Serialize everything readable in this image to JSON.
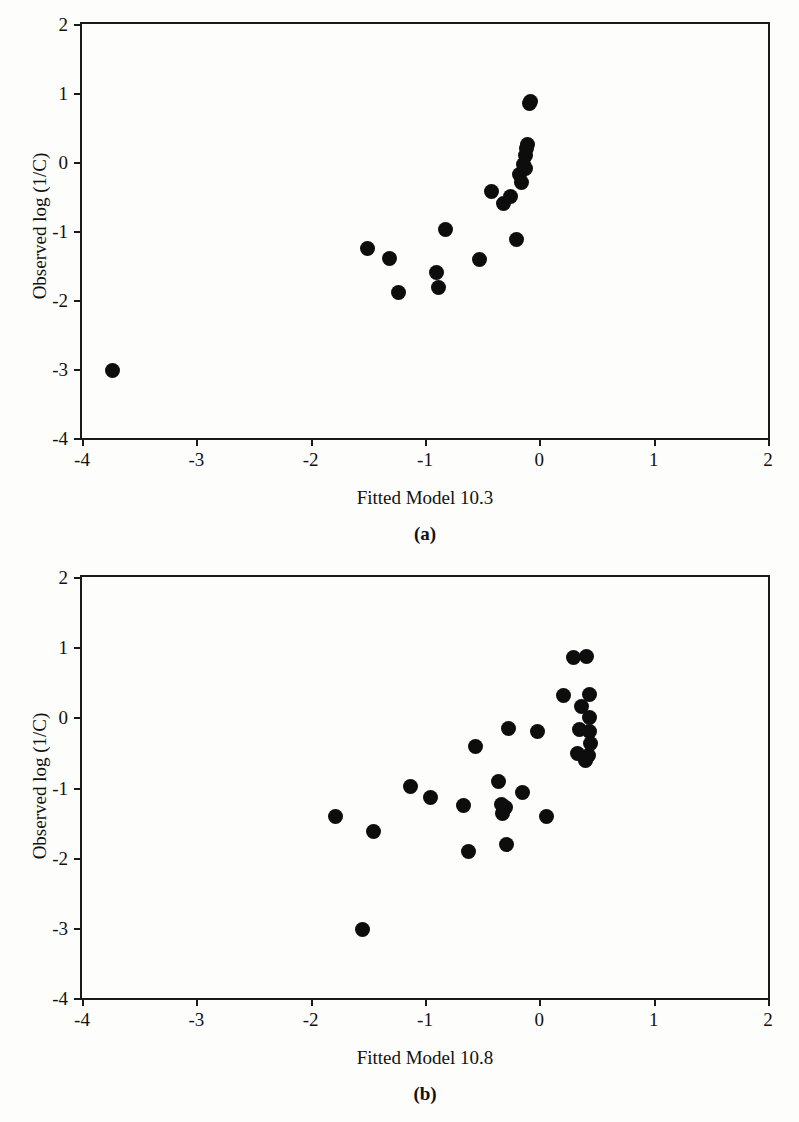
{
  "figure": {
    "background_color": "#fdfdfc",
    "marker_color": "#0d0d0d",
    "axis_color": "#1a1a1a"
  },
  "panels": [
    {
      "caption": "(a)",
      "chart_data": {
        "type": "scatter",
        "title": "",
        "xlabel": "Fitted Model 10.3",
        "ylabel": "Observed log (1/C)",
        "xlim": [
          -4,
          2
        ],
        "ylim": [
          -4,
          2
        ],
        "xticks": [
          -4,
          -3,
          -2,
          -1,
          0,
          1,
          2
        ],
        "xticklabels": [
          "-4",
          "-3",
          "-2",
          "-1",
          "0",
          "1",
          "2"
        ],
        "yticks": [
          -4,
          -3,
          -2,
          -1,
          0,
          1,
          2
        ],
        "yticklabels": [
          "-4",
          "-3",
          "-2",
          "-1",
          "0",
          "1",
          "2"
        ],
        "grid": false,
        "legend": false,
        "marker": "filled-circle",
        "points": [
          [
            -3.73,
            -3.02
          ],
          [
            -1.5,
            -1.25
          ],
          [
            -1.31,
            -1.4
          ],
          [
            -1.23,
            -1.89
          ],
          [
            -0.9,
            -1.6
          ],
          [
            -0.88,
            -1.82
          ],
          [
            -0.82,
            -0.98
          ],
          [
            -0.52,
            -1.41
          ],
          [
            -0.42,
            -0.43
          ],
          [
            -0.31,
            -0.6
          ],
          [
            -0.25,
            -0.5
          ],
          [
            -0.2,
            -1.13
          ],
          [
            -0.17,
            -0.18
          ],
          [
            -0.14,
            -0.03
          ],
          [
            -0.12,
            0.1
          ],
          [
            -0.11,
            0.2
          ],
          [
            -0.1,
            0.26
          ],
          [
            -0.12,
            -0.1
          ],
          [
            -0.09,
            0.85
          ],
          [
            -0.08,
            0.87
          ],
          [
            -0.16,
            -0.3
          ]
        ]
      }
    },
    {
      "caption": "(b)",
      "chart_data": {
        "type": "scatter",
        "title": "",
        "xlabel": "Fitted Model 10.8",
        "ylabel": "Observed log (1/C)",
        "xlim": [
          -4,
          2
        ],
        "ylim": [
          -4,
          2
        ],
        "xticks": [
          -4,
          -3,
          -2,
          -1,
          0,
          1,
          2
        ],
        "xticklabels": [
          "-4",
          "-3",
          "-2",
          "-1",
          "0",
          "1",
          "2"
        ],
        "yticks": [
          -4,
          -3,
          -2,
          -1,
          0,
          1,
          2
        ],
        "yticklabels": [
          "-4",
          "-3",
          "-2",
          "-1",
          "0",
          "1",
          "2"
        ],
        "grid": false,
        "legend": false,
        "marker": "filled-circle",
        "points": [
          [
            -1.55,
            -3.03
          ],
          [
            -1.78,
            -1.41
          ],
          [
            -1.45,
            -1.62
          ],
          [
            -1.13,
            -0.98
          ],
          [
            -0.95,
            -1.14
          ],
          [
            -0.66,
            -1.25
          ],
          [
            -0.62,
            -1.91
          ],
          [
            -0.56,
            -0.41
          ],
          [
            -0.36,
            -0.92
          ],
          [
            -0.33,
            -1.24
          ],
          [
            -0.3,
            -1.29
          ],
          [
            -0.32,
            -1.37
          ],
          [
            -0.29,
            -1.81
          ],
          [
            -0.27,
            -0.16
          ],
          [
            -0.15,
            -1.07
          ],
          [
            -0.02,
            -0.2
          ],
          [
            0.06,
            -1.42
          ],
          [
            0.21,
            0.31
          ],
          [
            0.3,
            0.85
          ],
          [
            0.41,
            0.86
          ],
          [
            0.44,
            0.33
          ],
          [
            0.37,
            0.15
          ],
          [
            0.44,
            0.0
          ],
          [
            0.35,
            -0.18
          ],
          [
            0.44,
            -0.2
          ],
          [
            0.45,
            -0.38
          ],
          [
            0.33,
            -0.52
          ],
          [
            0.43,
            -0.55
          ],
          [
            0.4,
            -0.62
          ]
        ]
      }
    }
  ]
}
